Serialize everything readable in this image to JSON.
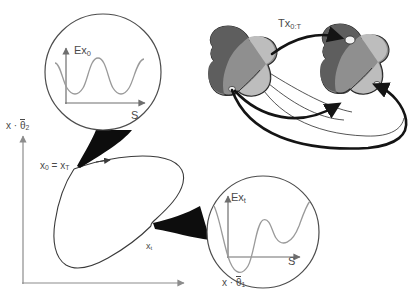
{
  "figure": {
    "type": "conformational-landscape-diagram",
    "background": "#ffffff",
    "width": 412,
    "height": 304
  },
  "axes": {
    "y_label": {
      "var": "x",
      "dot": "·",
      "param": "θ",
      "param_sub": "2"
    },
    "x_label": {
      "var": "x",
      "dot": "·",
      "param": "θ",
      "param_sub": "1"
    },
    "y_label_text": "x · θ̅2",
    "x_label_text": "x · θ̅1",
    "color": "#8c8c8c",
    "y_axis": {
      "x": 23,
      "y_top": 134,
      "y_bottom": 284
    },
    "x_axis": {
      "y": 283,
      "x_left": 22,
      "x_right": 186
    }
  },
  "trajectory": {
    "label": {
      "main": "Tx",
      "sub": "0:T"
    },
    "label_text": "Tx0:T",
    "color": "#3a3a3a",
    "arrow_direction": "clockwise",
    "nodes": [
      {
        "id": "start",
        "label_main": "x",
        "label_sub": "0",
        "label_eq": "=",
        "label_main2": "x",
        "label_sub2": "T",
        "label_text": "x0 = xT",
        "cx": 74,
        "cy": 169,
        "r": 7
      },
      {
        "id": "t",
        "label_main": "x",
        "label_sub": "t",
        "label_text": "xt",
        "cx": 151,
        "cy": 226,
        "r": 7
      }
    ]
  },
  "callouts": [
    {
      "id": "callout-start",
      "source_node": "x0 = xT",
      "circle": {
        "cx": 103,
        "cy": 72,
        "r": 58
      },
      "y_axis_label": {
        "main": "Ex",
        "sub": "0"
      },
      "y_axis_label_text": "Ex0",
      "x_axis_label": "S",
      "curve_type": "periodic-double-well",
      "curve_color": "#9a9a9a",
      "axis_color": "#6e6e6e"
    },
    {
      "id": "callout-t",
      "source_node": "xt",
      "circle": {
        "cx": 263,
        "cy": 232,
        "r": 56
      },
      "y_axis_label": {
        "main": "Ex",
        "sub": "t"
      },
      "y_axis_label_text": "Ext",
      "x_axis_label": "S",
      "curve_type": "irregular-rugged",
      "curve_color": "#9a9a9a",
      "axis_color": "#6e6e6e"
    }
  ],
  "molecules": {
    "count": 2,
    "shape": "bone-dumbbell",
    "colors": {
      "light": "#bdbdbd",
      "mid": "#8f8f8f",
      "dark": "#5e5e5e",
      "darker": "#4a4a4a",
      "outline": "#2b2b2b",
      "pocket": "#f2f2f2"
    },
    "left": {
      "cx": 253,
      "cy": 70
    },
    "right": {
      "cx": 363,
      "cy": 68
    },
    "arrows": [
      {
        "id": "arrow-top",
        "style": "thick-black",
        "from": "left-molecule",
        "to": "right-molecule-pocket"
      },
      {
        "id": "arrow-mid",
        "style": "thin-outline",
        "from": "left-molecule",
        "to": "right-molecule-mid"
      },
      {
        "id": "arrow-bottom",
        "style": "thick-black",
        "from": "left-molecule-pocket",
        "to": "right-molecule-lower"
      }
    ]
  }
}
